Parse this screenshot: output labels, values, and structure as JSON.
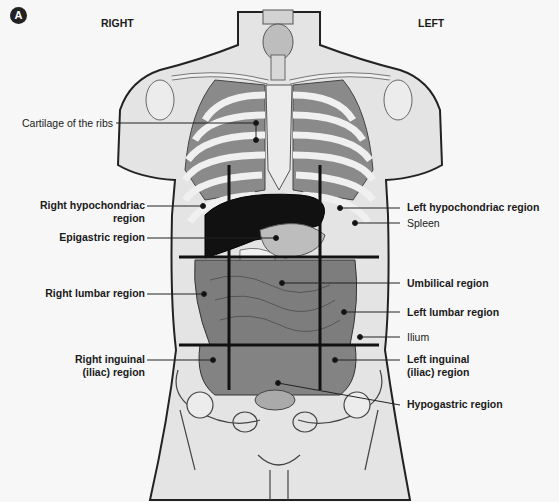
{
  "figure": {
    "panel_label": "A",
    "side_labels": {
      "right": "RIGHT",
      "left": "LEFT"
    },
    "colors": {
      "background": "#f7f7f7",
      "skin": "#e4e4e4",
      "outline": "#222222",
      "bone": "#ececec",
      "rib_muscle": "#8a8a8a",
      "organ_dark": "#111111",
      "intestine": "#7d7d7d",
      "grid_line": "#111111"
    },
    "labels_left": [
      {
        "text": "Cartilage of the ribs",
        "bold": false
      },
      {
        "text": "Right hypochondriac",
        "text2": "region",
        "bold": true
      },
      {
        "text": "Epigastric region",
        "bold": true
      },
      {
        "text": "Right lumbar region",
        "bold": true
      },
      {
        "text": "Right inguinal",
        "text2": "(iliac) region",
        "bold": true
      }
    ],
    "labels_right": [
      {
        "text": "Left hypochondriac region",
        "bold": true
      },
      {
        "text": "Spleen",
        "bold": false
      },
      {
        "text": "Umbilical region",
        "bold": true
      },
      {
        "text": "Left lumbar region",
        "bold": true
      },
      {
        "text": "Ilium",
        "bold": false
      },
      {
        "text": "Left inguinal",
        "text2": "(iliac) region",
        "bold": true
      },
      {
        "text": "Hypogastric region",
        "bold": true
      }
    ]
  }
}
